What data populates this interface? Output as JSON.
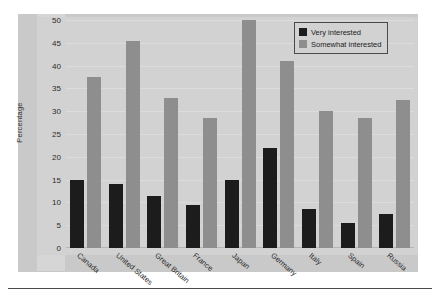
{
  "chart_data": {
    "type": "bar",
    "title": "",
    "subtitle": "",
    "xlabel": "",
    "ylabel": "Percentage",
    "ylim": [
      0,
      50
    ],
    "ytick_step": 5,
    "yticks": [
      50,
      45,
      40,
      35,
      30,
      25,
      20,
      15,
      10,
      5,
      0
    ],
    "grid": true,
    "legend_position": "top-right",
    "categories": [
      "Canada",
      "United States",
      "Great Britain",
      "France",
      "Japan",
      "Germany",
      "Italy",
      "Spain",
      "Russia"
    ],
    "series": [
      {
        "name": "Very interested",
        "color": "#1c1c1c",
        "values": [
          15,
          14,
          11.5,
          9.5,
          15,
          22,
          8.5,
          5.5,
          7.5
        ]
      },
      {
        "name": "Somewhat interested",
        "color": "#8e8e8e",
        "values": [
          37.5,
          45.5,
          33,
          28.5,
          50,
          41,
          30,
          28.5,
          32.5
        ]
      }
    ]
  },
  "legend": {
    "entries": [
      {
        "label": "Very interested",
        "swatch": "very"
      },
      {
        "label": "Somewhat interested",
        "swatch": "somewhat"
      }
    ]
  },
  "colors": {
    "very_interested": "#1c1c1c",
    "somewhat_interested": "#8e8e8e",
    "plot_background": "#d2d2d2",
    "card_background": "#c9c9c9",
    "gridline": "#dcdcdc",
    "rule": "#4a4a4a"
  }
}
